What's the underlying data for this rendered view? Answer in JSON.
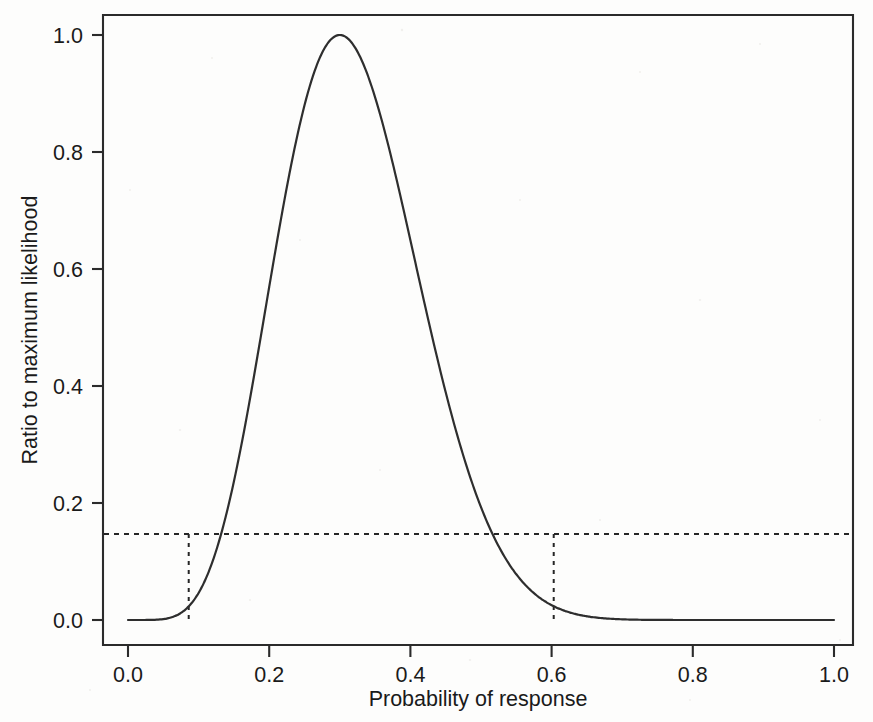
{
  "chart_data": {
    "type": "line",
    "title": "",
    "subtitle": "",
    "xlabel": "Probability of response",
    "ylabel": "Ratio to maximum likelihood",
    "xlim": [
      0.0,
      1.0
    ],
    "ylim": [
      0.0,
      1.0
    ],
    "grid": false,
    "legend": null,
    "xticks": [
      "0.0",
      "0.2",
      "0.4",
      "0.6",
      "0.8",
      "1.0"
    ],
    "xtick_values": [
      0.0,
      0.2,
      0.4,
      0.6,
      0.8,
      1.0
    ],
    "yticks": [
      "0.0",
      "0.2",
      "0.4",
      "0.6",
      "0.8",
      "1.0"
    ],
    "ytick_values": [
      0.0,
      0.2,
      0.4,
      0.6,
      0.8,
      1.0
    ],
    "series": [
      {
        "name": "Normalized likelihood",
        "color": "#2e2e2e",
        "style": "solid",
        "x": [
          0.0,
          0.01,
          0.02,
          0.03,
          0.04,
          0.05,
          0.06,
          0.07,
          0.08,
          0.09,
          0.1,
          0.11,
          0.12,
          0.13,
          0.14,
          0.15,
          0.16,
          0.17,
          0.18,
          0.19,
          0.2,
          0.21,
          0.22,
          0.23,
          0.24,
          0.25,
          0.26,
          0.27,
          0.28,
          0.29,
          0.3,
          0.31,
          0.32,
          0.33,
          0.34,
          0.35,
          0.36,
          0.37,
          0.38,
          0.39,
          0.4,
          0.42,
          0.44,
          0.46,
          0.48,
          0.5,
          0.52,
          0.54,
          0.56,
          0.58,
          0.6,
          0.62,
          0.64,
          0.66,
          0.68,
          0.7,
          0.72,
          0.74,
          0.76,
          0.78,
          0.8,
          0.84,
          0.88,
          0.92,
          0.96,
          1.0
        ],
        "y": [
          0.0,
          0.0,
          0.0,
          0.001,
          0.004,
          0.013,
          0.029,
          0.056,
          0.095,
          0.147,
          0.211,
          0.286,
          0.369,
          0.457,
          0.548,
          0.637,
          0.721,
          0.797,
          0.862,
          0.915,
          0.954,
          0.98,
          0.994,
          0.999,
          0.996,
          0.985,
          0.968,
          0.945,
          0.92,
          0.905,
          1.0,
          0.996,
          0.983,
          0.962,
          0.934,
          0.899,
          0.859,
          0.815,
          0.768,
          0.719,
          0.669,
          0.569,
          0.473,
          0.384,
          0.304,
          0.235,
          0.177,
          0.13,
          0.092,
          0.063,
          0.042,
          0.026,
          0.016,
          0.009,
          0.005,
          0.002,
          0.001,
          0.0,
          0.0,
          0.0,
          0.0,
          0.0,
          0.0,
          0.0,
          0.0,
          0.0
        ]
      }
    ],
    "annotations": {
      "reference_level": {
        "label": "support interval cutoff",
        "y_value": 0.147,
        "style": "dashed-horizontal",
        "color": "#262626"
      },
      "interval_bounds": {
        "label": "likelihood interval",
        "lower": 0.086,
        "upper": 0.603,
        "style": "dashed-vertical",
        "color": "#262626"
      },
      "maximum": {
        "label": "maximum likelihood estimate",
        "x_value": 0.3,
        "y_value": 1.0
      }
    },
    "model": {
      "description": "binomial normalized likelihood",
      "trials": 20,
      "successes": 6,
      "mle": 0.3
    }
  },
  "figure": {
    "background_color": "#fdfdfc",
    "axis_color": "#2b2b2b",
    "curve_color": "#2e2e2e",
    "reference_color": "#262626"
  }
}
